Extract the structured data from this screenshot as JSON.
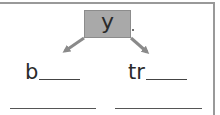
{
  "worksheet": {
    "center_letter": "y",
    "branches": [
      {
        "prefix": "b",
        "blank": "____"
      },
      {
        "prefix": "tr",
        "blank": "____"
      }
    ],
    "answer_lines": [
      "",
      ""
    ],
    "colors": {
      "box_fill": "#a9a9a9",
      "arrow": "#8a8a8a",
      "frame": "#999999",
      "text": "#2a2a2a"
    }
  }
}
